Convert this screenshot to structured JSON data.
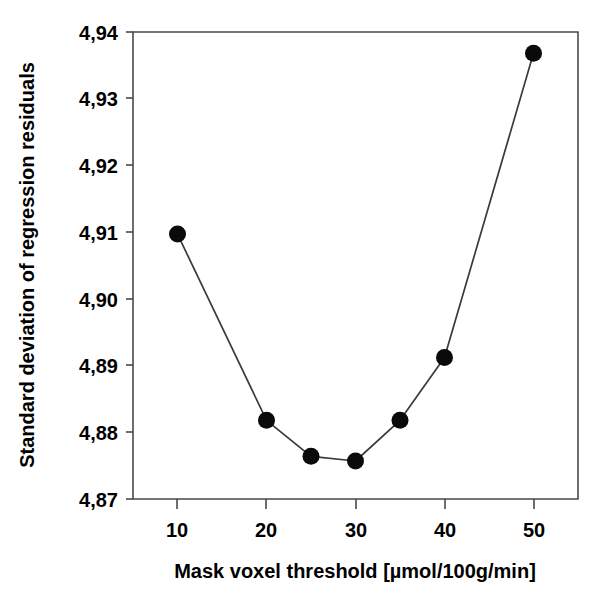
{
  "chart_data": {
    "type": "line",
    "title": "",
    "xlabel": "Mask voxel threshold [µmol/100g/min]",
    "ylabel": "Standard deviation of regression residuals",
    "x": [
      10,
      20,
      25,
      30,
      35,
      40,
      50
    ],
    "values": [
      4.9097,
      4.8818,
      4.8764,
      4.8757,
      4.8818,
      4.8912,
      4.9368
    ],
    "series": [
      {
        "name": "Standard deviation of regression residuals",
        "x": [
          10,
          20,
          25,
          30,
          35,
          40,
          50
        ],
        "values": [
          4.9097,
          4.8818,
          4.8764,
          4.8757,
          4.8818,
          4.8912,
          4.9368
        ]
      }
    ],
    "xlim": [
      5.0,
      55.0
    ],
    "ylim": [
      4.87,
      4.94
    ],
    "xticks": [
      10,
      20,
      30,
      40,
      50
    ],
    "xtick_labels": [
      "10",
      "20",
      "30",
      "40",
      "50"
    ],
    "yticks": [
      4.87,
      4.88,
      4.89,
      4.9,
      4.91,
      4.92,
      4.93,
      4.94
    ],
    "ytick_labels": [
      "4,87",
      "4,88",
      "4,89",
      "4,90",
      "4,91",
      "4,92",
      "4,93",
      "4,94"
    ],
    "grid": false,
    "legend": false,
    "legend_position": "none",
    "marker": "filled-circle",
    "marker_color": "#0a0a0a",
    "line_color": "#3a3a3a",
    "background_color": "#ffffff",
    "decimal_separator": ","
  },
  "axes": {
    "y_title": "Standard deviation of regression residuals",
    "x_title": "Mask voxel threshold [µmol/100g/min]",
    "y_labels": {
      "t0": "4,94",
      "t1": "4,93",
      "t2": "4,92",
      "t3": "4,91",
      "t4": "4,90",
      "t5": "4,89",
      "t6": "4,88",
      "t7": "4,87"
    },
    "x_labels": {
      "t0": "10",
      "t1": "20",
      "t2": "30",
      "t3": "40",
      "t4": "50"
    }
  }
}
